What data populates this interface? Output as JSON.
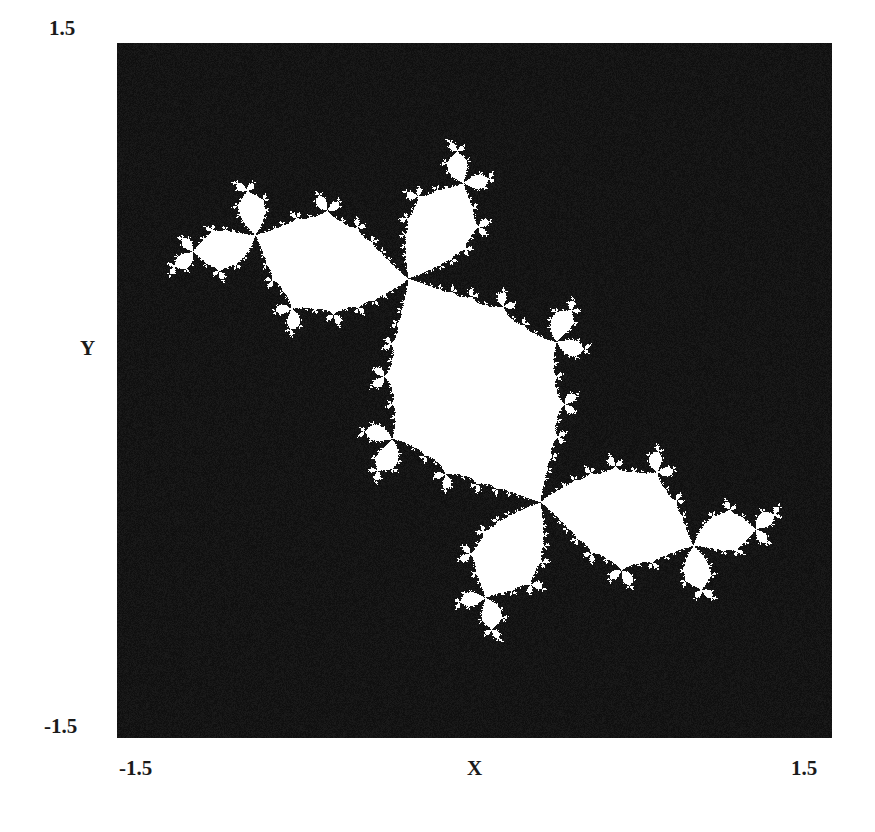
{
  "chart_data": {
    "type": "heatmap",
    "title": "",
    "julia_parameter": {
      "re": -0.12,
      "im": 0.75
    },
    "max_iterations": 120,
    "escape_radius": 2,
    "colors": {
      "inside": "#ffffff",
      "outside": "#121212"
    },
    "xlabel": "X",
    "ylabel": "Y",
    "xlim": [
      -1.5,
      1.5
    ],
    "ylim": [
      -1.5,
      1.5
    ],
    "x_tick_labels": [
      "-1.5",
      "1.5"
    ],
    "y_tick_labels": [
      "-1.5",
      "1.5"
    ],
    "grid": false,
    "legend": "none"
  },
  "axes": {
    "x_min_label": "-1.5",
    "x_max_label": "1.5",
    "y_min_label": "-1.5",
    "y_max_label": "1.5",
    "x_title": "X",
    "y_title": "Y"
  }
}
